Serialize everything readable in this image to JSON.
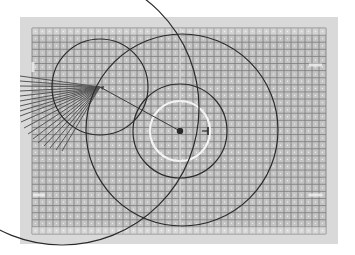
{
  "diagram": {
    "title": "Pitch grid with coverage circles",
    "canvas": {
      "width": 355,
      "height": 255,
      "background": "#ffffff"
    },
    "panel": {
      "x": 20,
      "y": 17,
      "width": 318,
      "height": 227,
      "fill": "#d9d9d9"
    },
    "grid": {
      "x": 32,
      "y": 28,
      "width": 294,
      "height": 206,
      "cell": 7,
      "fill": "#c4c4c4",
      "line_color": "#7a7a7a",
      "dot_color": "#efefef"
    },
    "field_markings": [
      {
        "type": "arc",
        "name": "center-circle",
        "cx": 180,
        "cy": 131,
        "r": 30,
        "color": "#f4f4f4",
        "width": 2.2
      },
      {
        "type": "line",
        "name": "halfway-line",
        "x1": 180,
        "y1": 28,
        "x2": 180,
        "y2": 234,
        "color": "#e2e2e2",
        "width": 1.2
      },
      {
        "type": "line",
        "name": "left-goal-mark",
        "x1": 33,
        "y1": 62,
        "x2": 33,
        "y2": 72,
        "color": "#f2f2f2",
        "width": 3
      },
      {
        "type": "line",
        "name": "left-goal-mark-2",
        "x1": 33,
        "y1": 195,
        "x2": 45,
        "y2": 195,
        "color": "#f2f2f2",
        "width": 3
      },
      {
        "type": "line",
        "name": "right-goal-mark",
        "x1": 309,
        "y1": 65,
        "x2": 322,
        "y2": 65,
        "color": "#f2f2f2",
        "width": 3
      },
      {
        "type": "line",
        "name": "right-goal-mark-2",
        "x1": 309,
        "y1": 195,
        "x2": 322,
        "y2": 195,
        "color": "#f2f2f2",
        "width": 3
      }
    ],
    "circles": [
      {
        "name": "outer-range-circle",
        "cx": 62,
        "cy": 108,
        "r": 137,
        "color": "#2a2a2a",
        "width": 1.2
      },
      {
        "name": "player-range-circle",
        "cx": 100,
        "cy": 87,
        "r": 48,
        "color": "#2a2a2a",
        "width": 1.2
      },
      {
        "name": "large-target-circle",
        "cx": 182,
        "cy": 130,
        "r": 96,
        "color": "#2a2a2a",
        "width": 1.2
      },
      {
        "name": "medium-target-circle",
        "cx": 180,
        "cy": 131,
        "r": 47,
        "color": "#2a2a2a",
        "width": 1.2
      }
    ],
    "fan": {
      "origin": {
        "x": 100,
        "y": 87
      },
      "color": "#555555",
      "width": 1,
      "endpoints": [
        [
          20,
          76
        ],
        [
          20,
          81
        ],
        [
          20,
          86
        ],
        [
          20,
          91
        ],
        [
          20,
          96
        ],
        [
          20,
          101
        ],
        [
          20,
          106
        ],
        [
          20,
          111
        ],
        [
          20,
          116
        ],
        [
          21,
          122
        ],
        [
          24,
          128
        ],
        [
          28,
          134
        ],
        [
          33,
          139
        ],
        [
          38,
          143
        ],
        [
          44,
          146
        ],
        [
          50,
          148
        ],
        [
          56,
          150
        ],
        [
          62,
          151
        ]
      ]
    },
    "arrow": {
      "from": {
        "x": 100,
        "y": 87
      },
      "to": {
        "x": 180,
        "y": 131
      },
      "color": "#3a3a3a",
      "width": 1,
      "head_dot_r": 3.2
    },
    "offset_marker": {
      "x": 208,
      "y": 131,
      "half_height": 4,
      "stub": 6,
      "color": "#2a2a2a"
    }
  }
}
